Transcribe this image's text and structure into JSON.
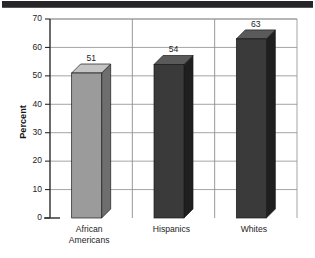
{
  "figure": {
    "scan_artifact": {
      "name": "top-scan-band",
      "color": "#26262a"
    },
    "background": "#ffffff"
  },
  "chart_data": {
    "type": "bar",
    "title": "",
    "subtitle": "",
    "xlabel": "",
    "ylabel": "Percent",
    "categories": [
      "African Americans",
      "Hispanics",
      "Whites"
    ],
    "category_lines": [
      [
        "African",
        "Americans"
      ],
      [
        "Hispanics"
      ],
      [
        "Whites"
      ]
    ],
    "values": [
      51,
      54,
      63
    ],
    "value_labels": [
      "51",
      "54",
      "63"
    ],
    "ylim": [
      0,
      70
    ],
    "ytick_step": 10,
    "ytick_labels": [
      "0",
      "10",
      "20",
      "30",
      "40",
      "50",
      "60",
      "70"
    ],
    "ytick_values": [
      0,
      10,
      20,
      30,
      40,
      50,
      60,
      70
    ],
    "grid": "horizontal-and-category-separators",
    "legend": "none",
    "style": "3d-extruded-columns",
    "bar_colors": [
      "#9b9b9b",
      "#3a3a3a",
      "#3a3a3a"
    ],
    "bar_top_colors": [
      "#c4c4c4",
      "#5a5a5a",
      "#5a5a5a"
    ],
    "bar_side_colors": [
      "#6e6e6e",
      "#1f1f1f",
      "#1f1f1f"
    ]
  },
  "axes": {
    "y_axis_title": "Percent",
    "y_axis_color": "#2b2b2b",
    "grid_color": "#8d8d8d"
  }
}
